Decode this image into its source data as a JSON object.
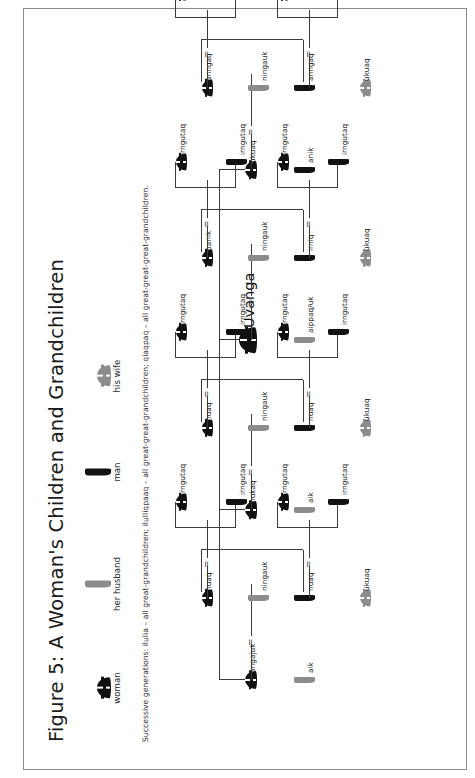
{
  "figure": {
    "title": "Figure 5: A Woman's Children and Grandchildren",
    "footnote": "Successive generations: ilulia – all great-grandchildren; ilulliqpaaq – all great-great-grandchildren; qiaqpaq – all great-great-great-grandchildren."
  },
  "legend": {
    "items": [
      {
        "caption": "woman",
        "icon": "female-black-icon",
        "sex": "female",
        "fill": "#111111"
      },
      {
        "caption": "her husband",
        "icon": "male-gray-icon",
        "sex": "male",
        "fill": "#8c8c8c"
      },
      {
        "caption": "man",
        "icon": "male-black-icon",
        "sex": "male",
        "fill": "#111111"
      },
      {
        "caption": "his wife",
        "icon": "female-gray-icon",
        "sex": "female",
        "fill": "#8c8c8c"
      }
    ]
  },
  "colors": {
    "black": "#111111",
    "gray": "#8c8c8c",
    "line": "#3b3b3b",
    "frame": "#8a8a8a"
  },
  "marriage_symbol": "=",
  "tree": {
    "ego": "Uvanga",
    "generations": [
      "ego-siblings",
      "children",
      "grandchildren"
    ],
    "families": [
      {
        "id": "fam-ukuaq",
        "self": {
          "label": "ukuaq",
          "sex": "female",
          "fill": "#111111"
        },
        "spouse": {
          "label": "anik",
          "sex": "male",
          "fill": "#111111"
        },
        "children": [
          {
            "child": {
              "label": "anngaq",
              "sex": "female",
              "fill": "#111111"
            },
            "inlaw": {
              "label": "ningauk",
              "sex": "male",
              "fill": "#8c8c8c"
            },
            "grandchildren": [
              {
                "label": "irngutaq",
                "sex": "female",
                "fill": "#111111"
              },
              {
                "label": "irngutaq",
                "sex": "male",
                "fill": "#111111"
              }
            ]
          },
          {
            "child": {
              "label": "anngaq",
              "sex": "male",
              "fill": "#111111"
            },
            "inlaw": {
              "label": "ukuaq",
              "sex": "female",
              "fill": "#8c8c8c"
            },
            "grandchildren": [
              {
                "label": "irngutaq",
                "sex": "female",
                "fill": "#111111"
              },
              {
                "label": "irngutaq",
                "sex": "male",
                "fill": "#111111"
              }
            ]
          }
        ]
      },
      {
        "id": "fam-uvanga",
        "self": {
          "label": "Uvanga",
          "sex": "female",
          "fill": "#111111",
          "emphasis": true
        },
        "spouse": {
          "label": "aippaq/uk",
          "sex": "male",
          "fill": "#8c8c8c"
        },
        "children": [
          {
            "child": {
              "label": "panik",
              "sex": "female",
              "fill": "#111111"
            },
            "inlaw": {
              "label": "ningauk",
              "sex": "male",
              "fill": "#8c8c8c"
            },
            "grandchildren": [
              {
                "label": "irngutaq",
                "sex": "female",
                "fill": "#111111"
              },
              {
                "label": "irngutaq",
                "sex": "male",
                "fill": "#111111"
              }
            ]
          },
          {
            "child": {
              "label": "irniq",
              "sex": "male",
              "fill": "#111111"
            },
            "inlaw": {
              "label": "ukuaq",
              "sex": "female",
              "fill": "#8c8c8c"
            },
            "grandchildren": [
              {
                "label": "irngutaq",
                "sex": "female",
                "fill": "#111111"
              },
              {
                "label": "irngutaq",
                "sex": "male",
                "fill": "#111111"
              }
            ]
          }
        ]
      },
      {
        "id": "fam-nukaq",
        "self": {
          "label": "nukaq",
          "sex": "female",
          "fill": "#111111"
        },
        "spouse": {
          "label": "aik",
          "sex": "male",
          "fill": "#8c8c8c"
        },
        "children": [
          {
            "child": {
              "label": "nuaq",
              "sex": "female",
              "fill": "#111111"
            },
            "inlaw": {
              "label": "ningauk",
              "sex": "male",
              "fill": "#8c8c8c"
            },
            "grandchildren": [
              {
                "label": "irngutaq",
                "sex": "female",
                "fill": "#111111"
              },
              {
                "label": "irngutaq",
                "sex": "male",
                "fill": "#111111"
              }
            ]
          },
          {
            "child": {
              "label": "nuaq",
              "sex": "male",
              "fill": "#111111"
            },
            "inlaw": {
              "label": "ukuaq",
              "sex": "female",
              "fill": "#8c8c8c"
            },
            "grandchildren": [
              {
                "label": "irngutaq",
                "sex": "female",
                "fill": "#111111"
              },
              {
                "label": "irngutaq",
                "sex": "male",
                "fill": "#111111"
              }
            ]
          }
        ]
      },
      {
        "id": "fam-angajuk",
        "self": {
          "label": "angajuk",
          "sex": "female",
          "fill": "#111111"
        },
        "spouse": {
          "label": "aik",
          "sex": "male",
          "fill": "#8c8c8c"
        },
        "children": [
          {
            "child": {
              "label": "nuaq",
              "sex": "female",
              "fill": "#111111"
            },
            "inlaw": {
              "label": "ningauk",
              "sex": "male",
              "fill": "#8c8c8c"
            },
            "grandchildren": [
              {
                "label": "irngutaq",
                "sex": "female",
                "fill": "#111111"
              },
              {
                "label": "irngutaq",
                "sex": "male",
                "fill": "#111111"
              }
            ]
          },
          {
            "child": {
              "label": "nuaq",
              "sex": "male",
              "fill": "#111111"
            },
            "inlaw": {
              "label": "ukuaq",
              "sex": "female",
              "fill": "#8c8c8c"
            },
            "grandchildren": [
              {
                "label": "irngutaq",
                "sex": "female",
                "fill": "#111111"
              },
              {
                "label": "irngutaq",
                "sex": "male",
                "fill": "#111111"
              }
            ]
          }
        ]
      }
    ]
  }
}
